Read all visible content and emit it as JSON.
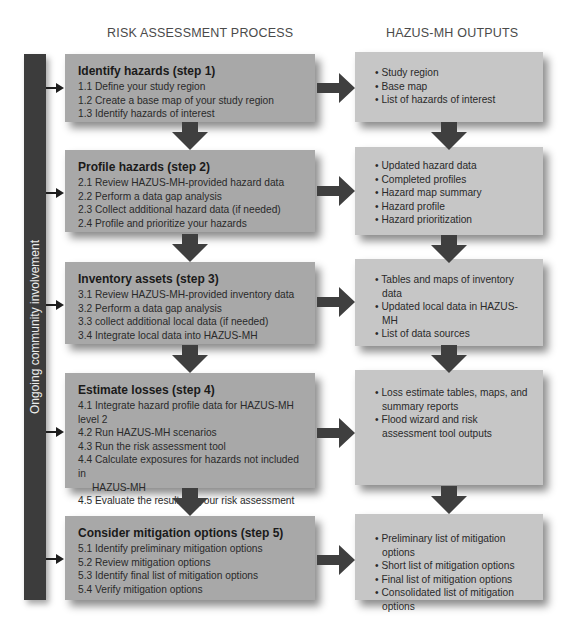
{
  "headers": {
    "left": "RISK ASSESSMENT PROCESS",
    "right": "HAZUS-MH OUTPUTS"
  },
  "side_bar": {
    "label": "Ongoing community involvement"
  },
  "colors": {
    "bar": "#3c3c3c",
    "arrow": "#3f3f3f",
    "left_box": "#a8a8a8",
    "right_box": "#c6c6c6"
  },
  "steps": [
    {
      "title": "Identify hazards (step 1)",
      "items": [
        "1.1 Define your study region",
        "1.2 Create a base map of your study region",
        "1.3 Identify hazards of interest"
      ],
      "outputs": [
        "Study region",
        "Base map",
        "List of hazards of interest"
      ]
    },
    {
      "title": "Profile hazards (step 2)",
      "items": [
        "2.1 Review HAZUS-MH-provided hazard data",
        "2.2 Perform a data gap analysis",
        "2.3 Collect additional hazard data (if needed)",
        "2.4 Profile and prioritize your hazards"
      ],
      "outputs": [
        "Updated hazard data",
        "Completed profiles",
        "Hazard map summary",
        "Hazard profile",
        "Hazard prioritization"
      ]
    },
    {
      "title": "Inventory assets (step 3)",
      "items": [
        "3.1 Review HAZUS-MH-provided inventory data",
        "3.2 Perform a data gap analysis",
        "3.3 collect additional local data (if needed)",
        "3.4 Integrate local data into HAZUS-MH"
      ],
      "outputs": [
        "Tables and maps of inventory data",
        "Updated local data in HAZUS-MH",
        "List of data sources"
      ]
    },
    {
      "title": "Estimate losses (step 4)",
      "items": [
        "4.1 Integrate hazard profile data for HAZUS-MH level 2",
        "4.2 Run HAZUS-MH scenarios",
        "4.3 Run the risk assessment tool",
        "4.4 Calculate exposures for hazards not included in",
        "HAZUS-MH",
        "4.5 Evaluate the results of your risk assessment"
      ],
      "outputs": [
        "Loss estimate tables, maps, and summary reports",
        "Flood wizard and risk assessment tool outputs"
      ]
    },
    {
      "title": "Consider mitigation options (step 5)",
      "items": [
        "5.1 Identify preliminary mitigation options",
        "5.2 Review mitigation options",
        "5.3 Identify final list of mitigation options",
        "5.4 Verify mitigation options"
      ],
      "outputs": [
        "Preliminary list of mitigation options",
        "Short list of mitigation options",
        "Final list of mitigation options",
        "Consolidated list of mitigation options"
      ]
    }
  ]
}
